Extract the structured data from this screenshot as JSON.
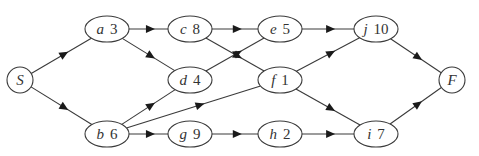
{
  "diagram": {
    "type": "activity-network",
    "nodes": [
      {
        "id": "S",
        "name": "S",
        "duration": "",
        "shape": "circle",
        "x": 20,
        "y": 80
      },
      {
        "id": "a",
        "name": "a",
        "duration": "3",
        "shape": "ellipse",
        "x": 107,
        "y": 29
      },
      {
        "id": "c",
        "name": "c",
        "duration": "8",
        "shape": "ellipse",
        "x": 190,
        "y": 29
      },
      {
        "id": "e",
        "name": "e",
        "duration": "5",
        "shape": "ellipse",
        "x": 280,
        "y": 29
      },
      {
        "id": "j",
        "name": "j",
        "duration": "10",
        "shape": "ellipse",
        "x": 376,
        "y": 29
      },
      {
        "id": "d",
        "name": "d",
        "duration": "4",
        "shape": "ellipse",
        "x": 190,
        "y": 80
      },
      {
        "id": "f",
        "name": "f",
        "duration": "1",
        "shape": "ellipse",
        "x": 280,
        "y": 80
      },
      {
        "id": "F",
        "name": "F",
        "duration": "",
        "shape": "circle",
        "x": 452,
        "y": 80
      },
      {
        "id": "b",
        "name": "b",
        "duration": "6",
        "shape": "ellipse",
        "x": 107,
        "y": 134
      },
      {
        "id": "g",
        "name": "g",
        "duration": "9",
        "shape": "ellipse",
        "x": 190,
        "y": 134
      },
      {
        "id": "h",
        "name": "h",
        "duration": "2",
        "shape": "ellipse",
        "x": 280,
        "y": 134
      },
      {
        "id": "i",
        "name": "i",
        "duration": "7",
        "shape": "ellipse",
        "x": 376,
        "y": 134
      }
    ],
    "edges": [
      {
        "from": "S",
        "to": "a"
      },
      {
        "from": "S",
        "to": "b"
      },
      {
        "from": "a",
        "to": "c"
      },
      {
        "from": "a",
        "to": "d"
      },
      {
        "from": "c",
        "to": "e"
      },
      {
        "from": "c",
        "to": "f"
      },
      {
        "from": "d",
        "to": "e"
      },
      {
        "from": "b",
        "to": "d"
      },
      {
        "from": "b",
        "to": "f"
      },
      {
        "from": "b",
        "to": "g"
      },
      {
        "from": "g",
        "to": "h"
      },
      {
        "from": "e",
        "to": "j"
      },
      {
        "from": "f",
        "to": "j"
      },
      {
        "from": "f",
        "to": "i"
      },
      {
        "from": "h",
        "to": "i"
      },
      {
        "from": "j",
        "to": "F"
      },
      {
        "from": "i",
        "to": "F"
      }
    ],
    "colors": {
      "stroke": "#3a3a3a",
      "text": "#333333",
      "background": "#ffffff"
    }
  }
}
